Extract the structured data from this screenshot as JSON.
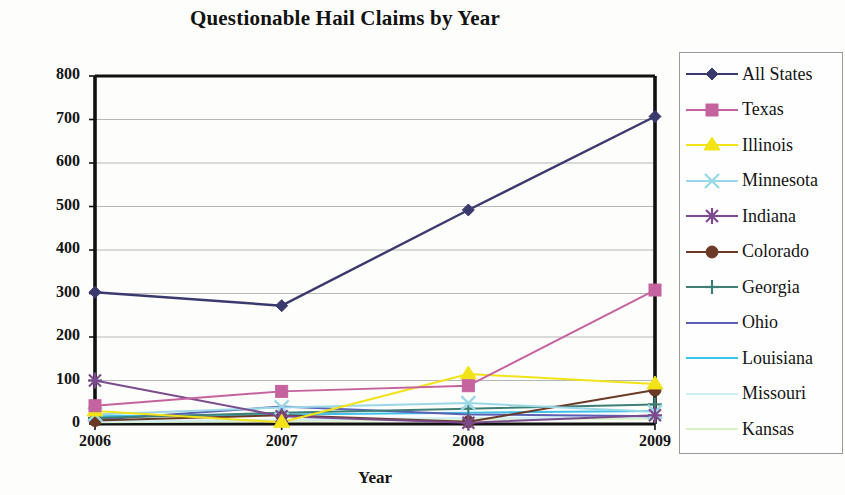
{
  "chart_data": {
    "type": "line",
    "title": "Questionable Hail Claims by Year",
    "xlabel": "Year",
    "ylabel": "# Claims",
    "categories": [
      "2006",
      "2007",
      "2008",
      "2009"
    ],
    "x": [
      2006,
      2007,
      2008,
      2009
    ],
    "ylim": [
      0,
      800
    ],
    "ytick_labels": [
      "0",
      "100",
      "200",
      "300",
      "400",
      "500",
      "600",
      "700",
      "800"
    ],
    "yticks": [
      0,
      100,
      200,
      300,
      400,
      500,
      600,
      700,
      800
    ],
    "grid": "horizontal",
    "legend_position": "right",
    "series": [
      {
        "name": "All States",
        "values": [
          303,
          272,
          492,
          707
        ],
        "color": "#3b3a6e",
        "marker": "diamond"
      },
      {
        "name": "Texas",
        "values": [
          42,
          75,
          88,
          308
        ],
        "color": "#c4639e",
        "marker": "square"
      },
      {
        "name": "Illinois",
        "values": [
          30,
          4,
          115,
          92
        ],
        "color": "#f2e317",
        "marker": "triangle"
      },
      {
        "name": "Minnesota",
        "values": [
          22,
          38,
          48,
          28
        ],
        "color": "#9ad8e8",
        "marker": "x"
      },
      {
        "name": "Indiana",
        "values": [
          100,
          18,
          3,
          20
        ],
        "color": "#7b4b8e",
        "marker": "star"
      },
      {
        "name": "Colorado",
        "values": [
          8,
          20,
          5,
          78
        ],
        "color": "#6b3a26",
        "marker": "circle"
      },
      {
        "name": "Georgia",
        "values": [
          14,
          26,
          35,
          45
        ],
        "color": "#3f7f75",
        "marker": "plus"
      },
      {
        "name": "Ohio",
        "values": [
          10,
          40,
          22,
          18
        ],
        "color": "#5b5fb5",
        "marker": "none"
      },
      {
        "name": "Louisiana",
        "values": [
          18,
          22,
          26,
          30
        ],
        "color": "#3fc0e8",
        "marker": "none"
      },
      {
        "name": "Missouri",
        "values": [
          6,
          10,
          14,
          16
        ],
        "color": "#cfeef5",
        "marker": "none"
      },
      {
        "name": "Kansas",
        "values": [
          4,
          7,
          10,
          12
        ],
        "color": "#dcf0c8",
        "marker": "none"
      }
    ]
  },
  "legend": {
    "items": [
      {
        "label": "All States"
      },
      {
        "label": "Texas"
      },
      {
        "label": "Illinois"
      },
      {
        "label": "Minnesota"
      },
      {
        "label": "Indiana"
      },
      {
        "label": "Colorado"
      },
      {
        "label": "Georgia"
      },
      {
        "label": "Ohio"
      },
      {
        "label": "Louisiana"
      },
      {
        "label": "Missouri"
      },
      {
        "label": "Kansas"
      }
    ]
  }
}
